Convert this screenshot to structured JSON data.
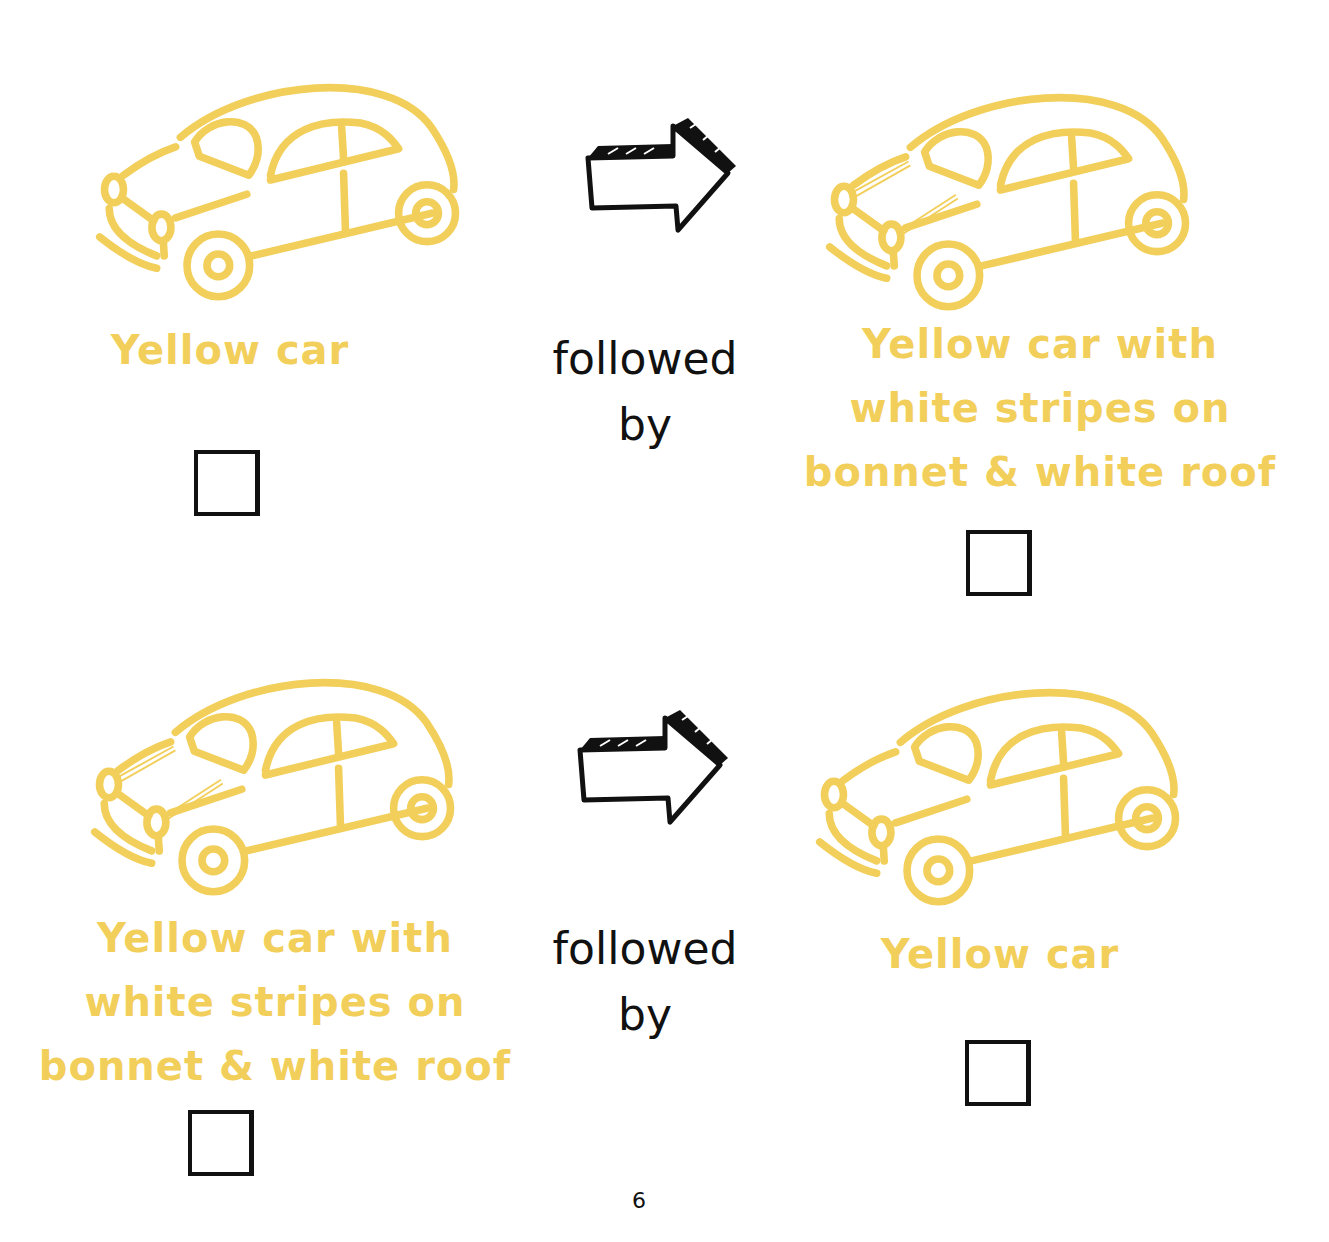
{
  "colors": {
    "car_yellow": "#f2cf5a",
    "text_yellow": "#f2cf5a",
    "ink": "#111111",
    "background": "#ffffff"
  },
  "rows": [
    {
      "left": {
        "icon": "yellow-car-icon",
        "label": "Yellow car",
        "checked": false
      },
      "connector": {
        "icon": "arrow-right-icon",
        "text_line1": "followed",
        "text_line2": "by"
      },
      "right": {
        "icon": "yellow-car-striped-icon",
        "label_line1": "Yellow car with",
        "label_line2": "white stripes on",
        "label_line3": "bonnet & white roof",
        "checked": false
      }
    },
    {
      "left": {
        "icon": "yellow-car-striped-icon",
        "label_line1": "Yellow car with",
        "label_line2": "white stripes on",
        "label_line3": "bonnet & white roof",
        "checked": false
      },
      "connector": {
        "icon": "arrow-right-icon",
        "text_line1": "followed",
        "text_line2": "by"
      },
      "right": {
        "icon": "yellow-car-icon",
        "label": "Yellow car",
        "checked": false
      }
    }
  ],
  "footer": {
    "page_number": "6"
  }
}
